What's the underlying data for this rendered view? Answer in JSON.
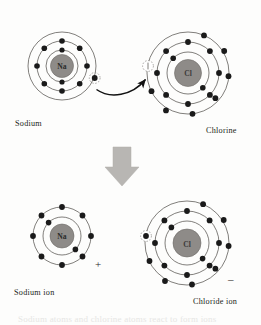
{
  "figure": {
    "background_color": "#fdfdfc",
    "nucleus_color": "#8e8b88",
    "nucleus_stroke": "#6e6b68",
    "shell_color": "#4a4744",
    "electron_color": "#1a1a1a",
    "arrow_color": "#b8b6b3",
    "text_color": "#231f20"
  },
  "top_row": {
    "sodium_atom": {
      "label": "Sodium",
      "nucleus_label": "Na",
      "shell_counts": [
        2,
        8,
        1
      ],
      "shell_radii": [
        16,
        25,
        34
      ],
      "nucleus_radius": 11.5,
      "center_x": 62,
      "center_y": 66,
      "highlighted_electron": "outer-valence-electron"
    },
    "chlorine_atom": {
      "label": "Chlorine",
      "nucleus_label": "Cl",
      "shell_counts": [
        2,
        8,
        7
      ],
      "shell_radii": [
        21,
        31,
        41
      ],
      "nucleus_radius": 13.5,
      "center_x": 188,
      "center_y": 73,
      "vacancy_marker": "empty-electron-slot"
    },
    "transfer_arrow": {
      "name": "electron-transfer-arrow",
      "from": "sodium valence electron",
      "to": "chlorine outer shell vacancy"
    }
  },
  "reaction_arrow": {
    "name": "reaction-down-arrow",
    "direction": "down",
    "color": "#b8b6b3"
  },
  "bottom_row": {
    "sodium_ion": {
      "label": "Sodium ion",
      "nucleus_label": "Na",
      "charge": "+",
      "shell_counts": [
        2,
        8
      ],
      "shell_radii": [
        19,
        29
      ],
      "nucleus_radius": 12,
      "center_x": 62,
      "center_y": 236
    },
    "chloride_ion": {
      "label": "Chloride ion",
      "nucleus_label": "Cl",
      "charge": "–",
      "shell_counts": [
        2,
        8,
        8
      ],
      "shell_radii": [
        22,
        32,
        42
      ],
      "nucleus_radius": 14,
      "center_x": 187,
      "center_y": 243,
      "gained_electron_marker": "transferred-electron"
    }
  },
  "footer": {
    "cut_off_caption": "Sodium atoms and chlorine atoms react to form ions"
  }
}
